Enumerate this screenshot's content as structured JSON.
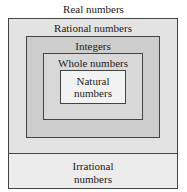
{
  "diagram": {
    "title": "Real numbers",
    "sets": {
      "rational": "Rational numbers",
      "integers": "Integers",
      "whole": "Whole numbers",
      "natural_line1": "Natural",
      "natural_line2": "numbers",
      "irrational_line1": "Irrational",
      "irrational_line2": "numbers"
    },
    "colors": {
      "rational_fill": "#e3e3e3",
      "integers_fill": "#cdcdcd",
      "whole_fill": "#d8d8d8",
      "natural_fill": "#f2f2f2",
      "irrational_fill": "#ececec",
      "border": "#444444"
    }
  }
}
